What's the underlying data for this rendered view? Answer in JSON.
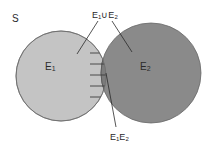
{
  "diagram": {
    "type": "venn",
    "universe_label": "S",
    "sets": [
      {
        "id": "E1",
        "label": "E",
        "sub": "1",
        "color": "#c4c4c4"
      },
      {
        "id": "E2",
        "label": "E",
        "sub": "2",
        "color": "#8a8a8a"
      }
    ],
    "union_label": {
      "a": "E",
      "a_sub": "1",
      "op": "∪",
      "b": "E",
      "b_sub": "2"
    },
    "intersection_label": {
      "a": "E",
      "a_sub": "1",
      "b": "E",
      "b_sub": "2"
    },
    "colors": {
      "stroke": "#6a6a6a",
      "intersection_fill": "#7c7c7c",
      "hatch": "#3c3c3c",
      "text": "#2a2a2a"
    }
  }
}
